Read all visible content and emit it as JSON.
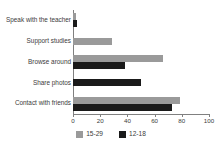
{
  "chart_data": {
    "type": "bar",
    "orientation": "horizontal",
    "title": "",
    "xlabel": "",
    "ylabel": "",
    "xlim": [
      0,
      100
    ],
    "xticks": [
      0,
      20,
      40,
      60,
      80,
      100
    ],
    "grid": false,
    "legend_position": "bottom",
    "categories": [
      "Speak with the teacher",
      "Support studies",
      "Browse around",
      "Share photos",
      "Contact with friends"
    ],
    "series": [
      {
        "name": "15-29",
        "color": "#9a9a9a",
        "values": [
          2,
          29,
          66,
          0,
          79
        ]
      },
      {
        "name": "12-18",
        "color": "#1a1a1a",
        "values": [
          3,
          0,
          38,
          50,
          73
        ]
      }
    ]
  },
  "legend": {
    "items": [
      {
        "label": "15-29"
      },
      {
        "label": "12-18"
      }
    ]
  },
  "axis": {
    "tick_labels": [
      "0",
      "20",
      "40",
      "60",
      "80",
      "100"
    ]
  }
}
